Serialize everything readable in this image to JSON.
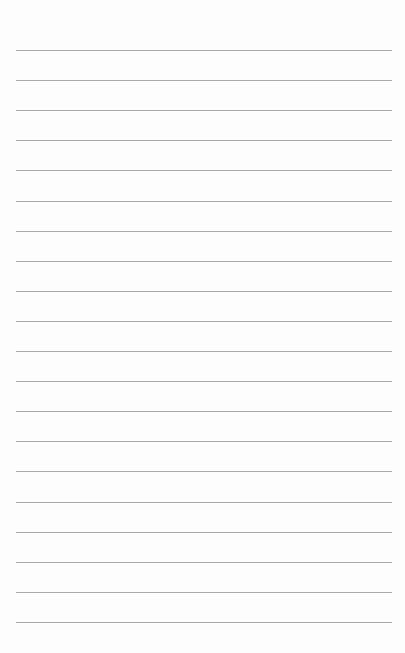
{
  "page": {
    "type": "lined-paper",
    "background_color": "#fdfdfd",
    "line_color": "#a9a9a9",
    "line_count": 20,
    "first_line_y": 50,
    "line_spacing": 30.1,
    "line_left": 16,
    "line_right": 392
  }
}
